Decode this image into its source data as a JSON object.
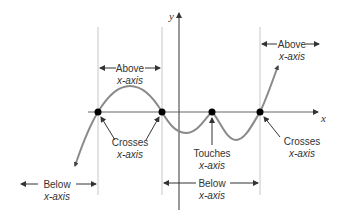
{
  "diagram": {
    "axes": {
      "x_label": "x",
      "y_label": "y"
    },
    "colors": {
      "curve": "#8a8a8a",
      "axis": "#555555",
      "guide": "#c8c8c8",
      "text": "#333333",
      "point": "#000000"
    },
    "points": [
      {
        "label": "Crosses x-axis",
        "x": 98
      },
      {
        "label": "Crosses x-axis",
        "x": 162
      },
      {
        "label": "Touches x-axis",
        "x": 212
      },
      {
        "label": "Crosses x-axis",
        "x": 260
      }
    ],
    "annotations": {
      "above1": {
        "line1": "Above",
        "line2": "x-axis"
      },
      "above2": {
        "line1": "Above",
        "line2": "x-axis"
      },
      "below1": {
        "line1": "Below",
        "line2": "x-axis"
      },
      "below2": {
        "line1": "Below",
        "line2": "x-axis"
      },
      "crosses1": {
        "line1": "Crosses",
        "line2": "x-axis"
      },
      "touches": {
        "line1": "Touches",
        "line2": "x-axis"
      },
      "crosses2": {
        "line1": "Crosses",
        "line2": "x-axis"
      }
    }
  }
}
